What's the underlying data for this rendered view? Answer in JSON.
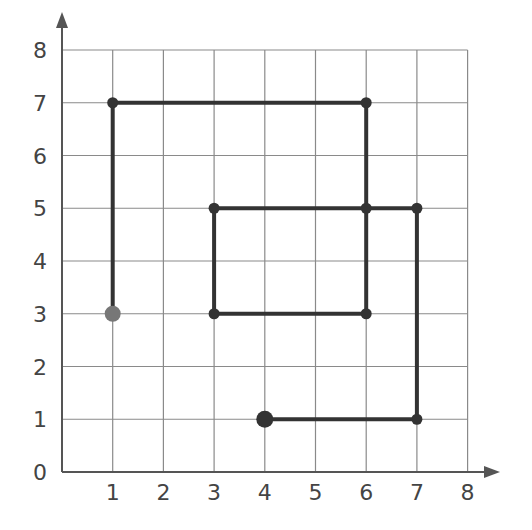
{
  "chart_data": {
    "type": "line",
    "title": "",
    "xlabel": "",
    "ylabel": "",
    "xlim": [
      0,
      8
    ],
    "ylim": [
      0,
      8
    ],
    "grid": true,
    "x_ticks": [
      "1",
      "2",
      "3",
      "4",
      "5",
      "6",
      "7",
      "8"
    ],
    "y_ticks": [
      "0",
      "1",
      "2",
      "3",
      "4",
      "5",
      "6",
      "7",
      "8"
    ],
    "path": [
      {
        "x": 1,
        "y": 3,
        "role": "start"
      },
      {
        "x": 1,
        "y": 7
      },
      {
        "x": 6,
        "y": 7
      },
      {
        "x": 6,
        "y": 3
      },
      {
        "x": 3,
        "y": 3
      },
      {
        "x": 3,
        "y": 5
      },
      {
        "x": 6,
        "y": 5
      },
      {
        "x": 7,
        "y": 5
      },
      {
        "x": 7,
        "y": 1
      },
      {
        "x": 4,
        "y": 1,
        "role": "end"
      }
    ],
    "colors": {
      "grid": "#8a8a8a",
      "axis": "#555555",
      "path": "#333333",
      "start_point": "#777777",
      "end_point": "#333333"
    }
  }
}
